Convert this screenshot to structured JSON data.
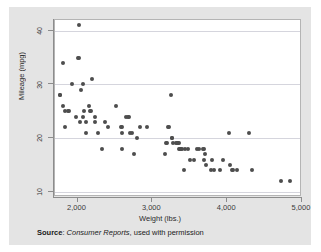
{
  "chart_data": {
    "type": "scatter",
    "title": "",
    "xlabel": "Weight (lbs.)",
    "ylabel": "Mileage (mpg)",
    "xlim": [
      1700,
      5000
    ],
    "ylim": [
      9,
      42
    ],
    "xticks": [
      2000,
      3000,
      4000,
      5000
    ],
    "xticklabels": [
      "2,000",
      "3,000",
      "4,000",
      "5,000"
    ],
    "yticks": [
      10,
      20,
      30,
      40
    ],
    "yticklabels": [
      "10",
      "20",
      "30",
      "40"
    ],
    "grid": "horizontal",
    "legend": "none",
    "marker_color": "#4d4d4d",
    "panel_color": "#ffffff",
    "figure_color": "#e4e4e4",
    "points": [
      [
        1760,
        28
      ],
      [
        1770,
        28
      ],
      [
        1800,
        34
      ],
      [
        1800,
        26
      ],
      [
        1830,
        25
      ],
      [
        1830,
        22
      ],
      [
        1870,
        25
      ],
      [
        1890,
        25
      ],
      [
        1930,
        30
      ],
      [
        1980,
        24
      ],
      [
        2000,
        35
      ],
      [
        2020,
        35
      ],
      [
        2020,
        41
      ],
      [
        2040,
        23
      ],
      [
        2050,
        29
      ],
      [
        2070,
        30
      ],
      [
        2070,
        24
      ],
      [
        2090,
        25
      ],
      [
        2110,
        21
      ],
      [
        2120,
        23
      ],
      [
        2160,
        26
      ],
      [
        2170,
        25
      ],
      [
        2180,
        25
      ],
      [
        2200,
        31
      ],
      [
        2230,
        24
      ],
      [
        2240,
        23
      ],
      [
        2280,
        21
      ],
      [
        2330,
        18
      ],
      [
        2370,
        23
      ],
      [
        2410,
        22
      ],
      [
        2520,
        26
      ],
      [
        2580,
        22
      ],
      [
        2590,
        22
      ],
      [
        2600,
        21
      ],
      [
        2600,
        18
      ],
      [
        2650,
        24
      ],
      [
        2670,
        24
      ],
      [
        2690,
        24
      ],
      [
        2700,
        21
      ],
      [
        2730,
        21
      ],
      [
        2750,
        17
      ],
      [
        2790,
        20
      ],
      [
        2830,
        22
      ],
      [
        2930,
        22
      ],
      [
        3170,
        17
      ],
      [
        3180,
        19
      ],
      [
        3200,
        19
      ],
      [
        3210,
        22
      ],
      [
        3220,
        22
      ],
      [
        3250,
        28
      ],
      [
        3260,
        20
      ],
      [
        3260,
        20
      ],
      [
        3280,
        19
      ],
      [
        3310,
        19
      ],
      [
        3330,
        19
      ],
      [
        3340,
        19
      ],
      [
        3350,
        19
      ],
      [
        3350,
        18
      ],
      [
        3370,
        18
      ],
      [
        3380,
        18
      ],
      [
        3400,
        18
      ],
      [
        3420,
        14
      ],
      [
        3430,
        18
      ],
      [
        3470,
        18
      ],
      [
        3500,
        16
      ],
      [
        3550,
        16
      ],
      [
        3600,
        18
      ],
      [
        3620,
        18
      ],
      [
        3670,
        18
      ],
      [
        3690,
        18
      ],
      [
        3690,
        16
      ],
      [
        3700,
        17
      ],
      [
        3720,
        15
      ],
      [
        3780,
        14
      ],
      [
        3800,
        16
      ],
      [
        3830,
        14
      ],
      [
        3900,
        14
      ],
      [
        3940,
        16
      ],
      [
        4030,
        21
      ],
      [
        4040,
        15
      ],
      [
        4060,
        14
      ],
      [
        4080,
        14
      ],
      [
        4130,
        14
      ],
      [
        4290,
        21
      ],
      [
        4330,
        14
      ],
      [
        4720,
        12
      ],
      [
        4840,
        12
      ]
    ]
  },
  "axes": {
    "y_title": "Mileage (mpg)",
    "x_title": "Weight (lbs.)"
  },
  "note": {
    "label": "Source",
    "separator": ": ",
    "publication": "Consumer Reports",
    "suffix": ", used with permission"
  }
}
